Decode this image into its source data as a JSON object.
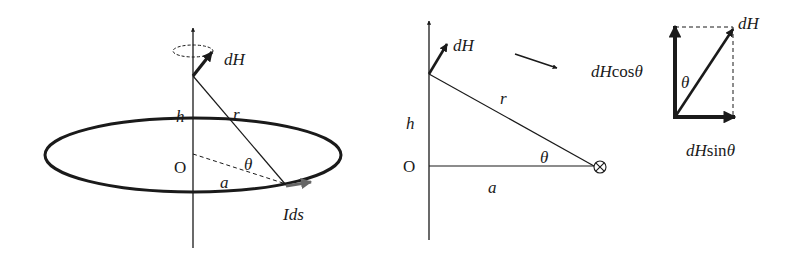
{
  "figure_left": {
    "labels": {
      "dH": "dH",
      "h": "h",
      "r": "r",
      "O": "O",
      "theta": "θ",
      "a": "a",
      "Ids": "Ids"
    }
  },
  "figure_middle": {
    "labels": {
      "dH": "dH",
      "r": "r",
      "h": "h",
      "O": "O",
      "theta": "θ",
      "a": "a",
      "current_into_page": "⊗"
    }
  },
  "figure_right": {
    "labels": {
      "dH": "dH",
      "dHcos_prefix": "dH",
      "dHcos_func": "cos",
      "dHcos_theta": "θ",
      "theta": "θ",
      "dHsin_prefix": "dH",
      "dHsin_func": "sin",
      "dHsin_theta": "θ"
    }
  },
  "colors": {
    "stroke": "#1a1a1a",
    "ids_arrow": "#666666"
  }
}
